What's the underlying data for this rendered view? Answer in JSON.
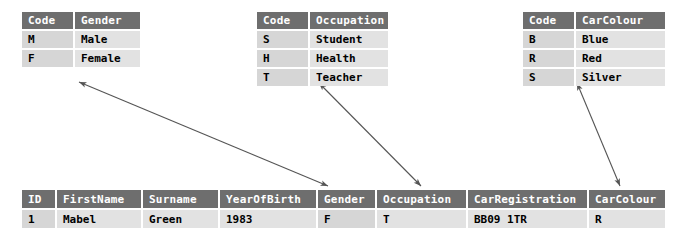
{
  "diagram": {
    "accent_header_color": "#6e6e6e",
    "key_cell_color": "#d6d6d6",
    "value_cell_color": "#e2e2e2",
    "arrow_color": "#555555"
  },
  "lookup_tables": [
    {
      "name": "gender-lookup-table",
      "headers": [
        "Code",
        "Gender"
      ],
      "rows": [
        [
          "M",
          "Male"
        ],
        [
          "F",
          "Female"
        ]
      ]
    },
    {
      "name": "occupation-lookup-table",
      "headers": [
        "Code",
        "Occupation"
      ],
      "rows": [
        [
          "S",
          "Student"
        ],
        [
          "H",
          "Health"
        ],
        [
          "T",
          "Teacher"
        ]
      ]
    },
    {
      "name": "carcolour-lookup-table",
      "headers": [
        "Code",
        "CarColour"
      ],
      "rows": [
        [
          "B",
          "Blue"
        ],
        [
          "R",
          "Red"
        ],
        [
          "S",
          "Silver"
        ]
      ]
    }
  ],
  "main_table": {
    "name": "person-records-table",
    "headers": [
      "ID",
      "FirstName",
      "Surname",
      "YearOfBirth",
      "Gender",
      "Occupation",
      "CarRegistration",
      "CarColour"
    ],
    "rows": [
      [
        "1",
        "Mabel",
        "Green",
        "1983",
        "F",
        "T",
        "BB09 1TR",
        "R"
      ]
    ]
  },
  "relationships": [
    {
      "name": "gender-relationship",
      "from": "gender-lookup-table",
      "to": "Gender",
      "style": "double-headed-arrow"
    },
    {
      "name": "occupation-relationship",
      "from": "occupation-lookup-table",
      "to": "Occupation",
      "style": "double-headed-arrow"
    },
    {
      "name": "carcolour-relationship",
      "from": "carcolour-lookup-table",
      "to": "CarColour",
      "style": "double-headed-arrow"
    }
  ]
}
